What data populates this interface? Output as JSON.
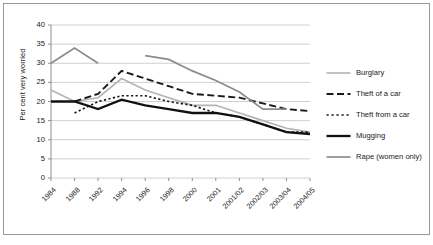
{
  "chart_data": {
    "type": "line",
    "title": "",
    "xlabel": "",
    "ylabel": "Per cent very worried",
    "ylim": [
      0,
      40
    ],
    "ytick_step": 5,
    "yticks": [
      "40",
      "35",
      "30",
      "25",
      "20",
      "15",
      "10",
      "5",
      "0"
    ],
    "grid": true,
    "legend_position": "right",
    "categories": [
      "1984",
      "1988",
      "1992",
      "1994",
      "1996",
      "1998",
      "2000",
      "2001",
      "2001/02",
      "2002/03",
      "2003/04",
      "2004/05"
    ],
    "series": [
      {
        "name": "Burglary",
        "color": "#b3b3b3",
        "style": "solid",
        "width": 1.6,
        "values": [
          23,
          20,
          21,
          26,
          23,
          21,
          19,
          19,
          17,
          15,
          13,
          12
        ]
      },
      {
        "name": "Theft of a car",
        "color": "#1a1a1a",
        "style": "dashed",
        "width": 1.9,
        "values": [
          null,
          20,
          22,
          28,
          26,
          24,
          22,
          21.5,
          21,
          19.5,
          18,
          17.5
        ]
      },
      {
        "name": "Theft from a car",
        "color": "#1a1a1a",
        "style": "dotted",
        "width": 1.7,
        "values": [
          null,
          17,
          20,
          21.5,
          21.5,
          20,
          19,
          17,
          16,
          14,
          12,
          12
        ]
      },
      {
        "name": "Mugging",
        "color": "#111111",
        "style": "solid",
        "width": 2.3,
        "values": [
          20,
          20,
          18,
          20.5,
          19,
          18,
          17,
          17,
          16,
          14,
          12,
          11.5
        ]
      },
      {
        "name": "Rape (women only)",
        "color": "#8c8c8c",
        "style": "solid",
        "width": 1.7,
        "values": [
          30,
          34,
          30,
          null,
          32,
          31,
          28,
          25.5,
          22.5,
          18,
          18,
          null
        ]
      }
    ]
  },
  "legend": {
    "items": [
      {
        "label": "Burglary",
        "icon": "line-solid-gray-icon"
      },
      {
        "label": "Theft of a car",
        "icon": "line-dashed-black-icon"
      },
      {
        "label": "Theft from a car",
        "icon": "line-dotted-black-icon"
      },
      {
        "label": "Mugging",
        "icon": "line-solid-black-thick-icon"
      },
      {
        "label": "Rape (women only)",
        "icon": "line-solid-midgray-icon"
      }
    ]
  },
  "axis": {
    "y_title": "Per cent very worried"
  }
}
